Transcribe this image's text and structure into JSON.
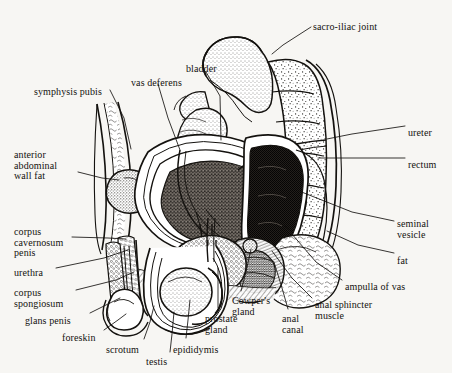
{
  "figure": {
    "type": "anatomical-line-diagram",
    "background_color": "#f7f6f3",
    "ink_color": "#14120f",
    "width": 452,
    "height": 373
  },
  "labels": [
    {
      "id": "sacro-iliac-joint",
      "text": "sacro-iliac joint",
      "x": 313,
      "y": 22,
      "align": "left"
    },
    {
      "id": "bladder",
      "text": "bladder",
      "x": 186,
      "y": 64,
      "align": "left"
    },
    {
      "id": "vas-deferens",
      "text": "vas deferens",
      "x": 131,
      "y": 78,
      "align": "left"
    },
    {
      "id": "symphysis-pubis",
      "text": "symphysis pubis",
      "x": 34,
      "y": 87,
      "align": "left"
    },
    {
      "id": "ureter",
      "text": "ureter",
      "x": 408,
      "y": 128,
      "align": "left"
    },
    {
      "id": "rectum",
      "text": "rectum",
      "x": 408,
      "y": 160,
      "align": "left"
    },
    {
      "id": "anterior-abdominal-wall-fat",
      "text": "anterior\nabdominal\nwall fat",
      "x": 14,
      "y": 150,
      "align": "left"
    },
    {
      "id": "corpus-cavernosum-penis",
      "text": "corpus\ncavernosum\npenis",
      "x": 14,
      "y": 227,
      "align": "left"
    },
    {
      "id": "seminal-vesicle",
      "text": "seminal\nvesicle",
      "x": 397,
      "y": 219,
      "align": "left"
    },
    {
      "id": "fat",
      "text": "fat",
      "x": 397,
      "y": 256,
      "align": "left"
    },
    {
      "id": "urethra",
      "text": "urethra",
      "x": 14,
      "y": 268,
      "align": "left"
    },
    {
      "id": "ampulla-of-vas",
      "text": "ampulla of vas",
      "x": 345,
      "y": 282,
      "align": "left"
    },
    {
      "id": "corpus-spongiosum",
      "text": "corpus\nspongiosum",
      "x": 14,
      "y": 288,
      "align": "left"
    },
    {
      "id": "anal-sphincter-muscle",
      "text": "anal sphincter\nmuscle",
      "x": 315,
      "y": 300,
      "align": "left"
    },
    {
      "id": "cowpers-gland",
      "text": "Cowper's\ngland",
      "x": 232,
      "y": 296,
      "align": "left"
    },
    {
      "id": "glans-penis",
      "text": "glans penis",
      "x": 25,
      "y": 316,
      "align": "left"
    },
    {
      "id": "prostate-gland",
      "text": "prostate\ngland",
      "x": 205,
      "y": 314,
      "align": "left"
    },
    {
      "id": "anal-canal",
      "text": "anal\ncanal",
      "x": 282,
      "y": 314,
      "align": "left"
    },
    {
      "id": "foreskin",
      "text": "foreskin",
      "x": 62,
      "y": 333,
      "align": "left"
    },
    {
      "id": "scrotum",
      "text": "scrotum",
      "x": 106,
      "y": 345,
      "align": "left"
    },
    {
      "id": "epididymis",
      "text": "epididymis",
      "x": 173,
      "y": 345,
      "align": "left"
    },
    {
      "id": "testis",
      "text": "testis",
      "x": 146,
      "y": 357,
      "align": "left"
    }
  ],
  "leader_lines": [
    {
      "id": "sacro-iliac-joint",
      "points": "311,27 283,45 272,54"
    },
    {
      "id": "bladder",
      "points": "206,72 220,96 221,140"
    },
    {
      "id": "vas-deferens",
      "points": "158,84 168,118 180,150"
    },
    {
      "id": "symphysis-pubis",
      "points": "110,90 124,118 131,149"
    },
    {
      "id": "ureter",
      "points": "405,126 352,134 327,139"
    },
    {
      "id": "rectum",
      "points": "405,158 342,158 318,158"
    },
    {
      "id": "anterior-abdominal-wall-fat",
      "points": "78,172 102,178 119,180"
    },
    {
      "id": "corpus-cavernosum-penis",
      "points": "72,237 108,238 126,239"
    },
    {
      "id": "seminal-vesicle",
      "points": "394,221 352,212 299,191"
    },
    {
      "id": "fat",
      "points": "394,253 358,245 327,231"
    },
    {
      "id": "urethra",
      "points": "56,268 104,258 128,250"
    },
    {
      "id": "ampulla-of-vas",
      "points": "342,280 316,262 285,226"
    },
    {
      "id": "corpus-spongiosum",
      "points": "76,290 116,280 134,272"
    },
    {
      "id": "anal-sphincter-muscle",
      "points": "312,298 292,278 272,251"
    },
    {
      "id": "cowpers-gland",
      "points": "241,291 246,272 251,249"
    },
    {
      "id": "glans-penis",
      "points": "90,313 110,303 120,298"
    },
    {
      "id": "prostate-gland",
      "points": "218,310 218,292 218,268"
    },
    {
      "id": "anal-canal",
      "points": "288,309 282,288 274,262"
    },
    {
      "id": "foreskin",
      "points": "104,330 118,320 126,314"
    },
    {
      "id": "scrotum",
      "points": "144,339 150,322 154,306"
    },
    {
      "id": "epididymis",
      "points": "186,338 188,320 190,300"
    },
    {
      "id": "testis",
      "points": "170,352 172,334 174,312"
    }
  ],
  "structures": [
    {
      "id": "sacrum",
      "name": "sacrum"
    },
    {
      "id": "iliac-bone",
      "name": "iliac bone"
    },
    {
      "id": "vertebral-column",
      "name": "vertebral column"
    },
    {
      "id": "bladder-cavity",
      "name": "bladder"
    },
    {
      "id": "rectum-body",
      "name": "rectum"
    },
    {
      "id": "prostate-body",
      "name": "prostate gland"
    },
    {
      "id": "seminal-vesicle-body",
      "name": "seminal vesicle"
    },
    {
      "id": "penis-shaft",
      "name": "penis shaft"
    },
    {
      "id": "scrotal-sac",
      "name": "scrotal sac"
    },
    {
      "id": "testis-body",
      "name": "testis"
    },
    {
      "id": "epididymis-body",
      "name": "epididymis"
    },
    {
      "id": "abdominal-wall",
      "name": "anterior abdominal wall"
    },
    {
      "id": "pubic-bone",
      "name": "symphysis pubis"
    }
  ]
}
